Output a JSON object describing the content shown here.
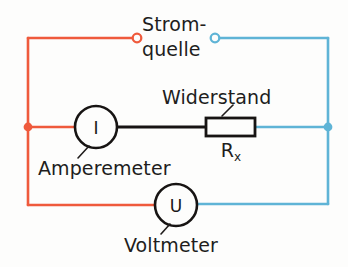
{
  "diagram": {
    "labels": {
      "source_line1": "Strom-",
      "source_line2": "quelle",
      "resistor": "Widerstand",
      "resistor_symbol": "R",
      "resistor_subscript": "x",
      "ammeter": "Amperemeter",
      "voltmeter": "Voltmeter"
    },
    "symbols": {
      "ammeter_letter": "I",
      "voltmeter_letter": "U"
    },
    "colors": {
      "positive_wire": "#ef5a3c",
      "negative_wire": "#5fb4d6",
      "component_wire": "#171413",
      "text": "#211d1c",
      "background": "#fdfdfc"
    },
    "terminals": {
      "positive_terminal": "open-circle-red",
      "negative_terminal": "open-circle-blue",
      "left_junction": "filled-dot-red",
      "right_junction": "filled-dot-blue"
    }
  }
}
